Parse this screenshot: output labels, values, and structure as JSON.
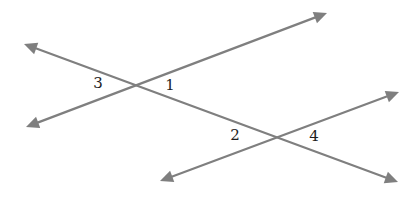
{
  "diagram": {
    "type": "two lines cut by a transversal",
    "line_color": "#7f7f7f",
    "label_color": "#1e1e1e",
    "background": "#ffffff",
    "lines": [
      {
        "id": "transversal",
        "start": [
          24,
          44
        ],
        "end": [
          398,
          182
        ],
        "arrows": "both"
      },
      {
        "id": "upper-line",
        "start": [
          26,
          127
        ],
        "end": [
          327,
          13
        ],
        "arrows": "both"
      },
      {
        "id": "lower-line",
        "start": [
          160,
          181
        ],
        "end": [
          399,
          92
        ],
        "arrows": "both"
      }
    ],
    "intersections": [
      {
        "id": "upper-intersection",
        "point": [
          133,
          84
        ]
      },
      {
        "id": "lower-intersection",
        "point": [
          277,
          137
        ]
      }
    ],
    "angle_labels": [
      {
        "text": "3",
        "x": 98,
        "y": 83
      },
      {
        "text": "1",
        "x": 170,
        "y": 85
      },
      {
        "text": "2",
        "x": 235,
        "y": 135
      },
      {
        "text": "4",
        "x": 314,
        "y": 136
      }
    ]
  }
}
